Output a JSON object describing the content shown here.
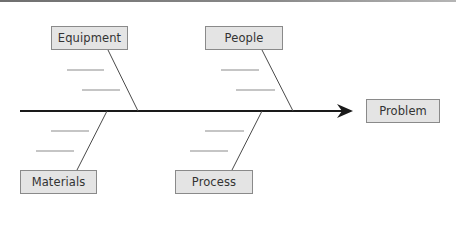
{
  "diagram": {
    "type": "fishbone",
    "effect": {
      "label": "Problem"
    },
    "categories": [
      {
        "id": "equipment",
        "label": "Equipment",
        "side": "top",
        "sub_causes": [
          "",
          ""
        ]
      },
      {
        "id": "people",
        "label": "People",
        "side": "top",
        "sub_causes": [
          "",
          ""
        ]
      },
      {
        "id": "materials",
        "label": "Materials",
        "side": "bottom",
        "sub_causes": [
          "",
          ""
        ]
      },
      {
        "id": "process",
        "label": "Process",
        "side": "bottom",
        "sub_causes": [
          "",
          ""
        ]
      }
    ],
    "colors": {
      "spine": "#1a1a1a",
      "bone": "#4a4a4a",
      "sub_line": "#8c8c8c",
      "box_fill": "#e4e4e4",
      "box_border": "#8a8a8a",
      "text": "#333333"
    }
  }
}
